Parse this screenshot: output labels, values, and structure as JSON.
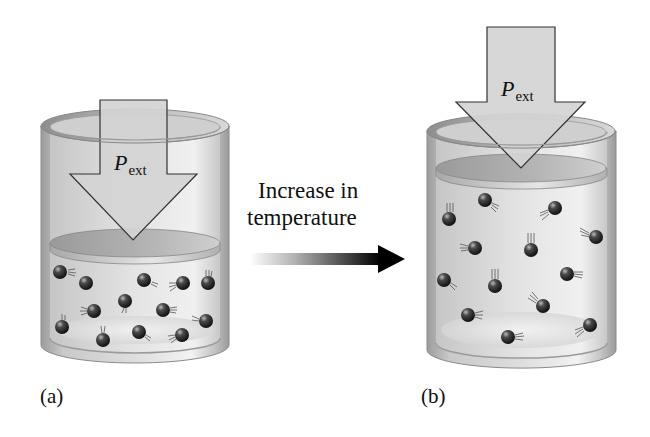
{
  "diagram": {
    "caption": {
      "line1": "Increase in",
      "line2": "temperature"
    },
    "panels": [
      {
        "id": "a",
        "label": "(a)",
        "arrow_label_main": "P",
        "arrow_label_sub": "ext",
        "molecule_count": 13,
        "state": "lower temperature, smaller volume"
      },
      {
        "id": "b",
        "label": "(b)",
        "arrow_label_main": "P",
        "arrow_label_sub": "ext",
        "molecule_count": 13,
        "state": "higher temperature, larger volume"
      }
    ],
    "colors": {
      "cylinder_wall": "#b8b8b8",
      "cylinder_dark": "#8a8a8a",
      "gas_fill": "#dcdcdc",
      "piston": "#a9a9a9",
      "arrow_fill": "#d2d2d2",
      "arrow_stroke": "#333333",
      "molecule": "#2a2a2a",
      "transition_arrow": "#111111"
    }
  }
}
